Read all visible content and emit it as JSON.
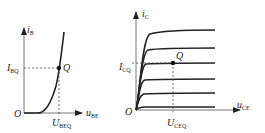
{
  "left_plot": {
    "title": "Input characteristic",
    "y_axis": {
      "label": "i",
      "sub": "B"
    },
    "x_axis": {
      "label": "u",
      "sub": "BE"
    },
    "origin": "O",
    "q_point": {
      "label": "Q"
    },
    "y_marker": {
      "label": "I",
      "sub": "BQ"
    },
    "x_marker": {
      "label": "U",
      "sub": "BEQ"
    }
  },
  "right_plot": {
    "title": "Output characteristics",
    "y_axis": {
      "label": "i",
      "sub": "C"
    },
    "x_axis": {
      "label": "u",
      "sub": "CE"
    },
    "origin": "O",
    "q_point": {
      "label": "Q"
    },
    "y_marker": {
      "label": "I",
      "sub": "CQ"
    },
    "x_marker": {
      "label": "U",
      "sub": "CEQ"
    },
    "curve_count": 6
  },
  "colors": {
    "line": "#222222",
    "dash": "#444444"
  }
}
